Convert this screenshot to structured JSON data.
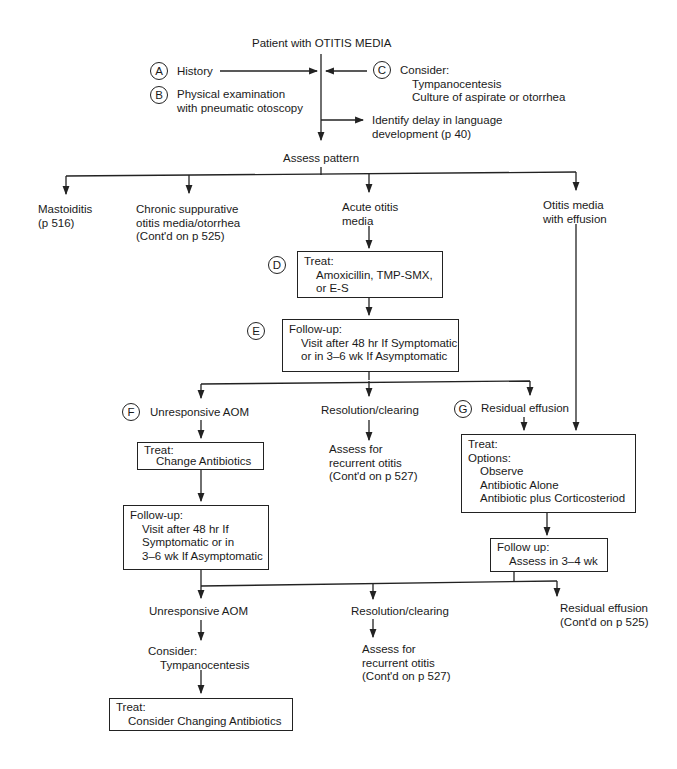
{
  "title": "Patient with OTITIS MEDIA",
  "steps": {
    "A": {
      "letter": "A",
      "text": "History"
    },
    "B": {
      "letter": "B",
      "line1": "Physical examination",
      "line2": "with pneumatic otoscopy"
    },
    "C": {
      "letter": "C",
      "heading": "Consider:",
      "items": [
        "Tympanocentesis",
        "Culture of aspirate or otorrhea"
      ]
    },
    "identify": {
      "line1": "Identify delay in language",
      "line2": "development (p 40)"
    },
    "assess": "Assess pattern"
  },
  "patterns": {
    "mastoiditis": {
      "line1": "Mastoiditis",
      "line2": "(p 516)"
    },
    "chronic": {
      "line1": "Chronic suppurative",
      "line2": "otitis media/otorrhea",
      "line3": "(Cont'd on p 525)"
    },
    "acute": {
      "line1": "Acute otitis",
      "line2": "media"
    },
    "effusion": {
      "line1": "Otitis media",
      "line2": "with effusion"
    }
  },
  "D": {
    "letter": "D",
    "heading": "Treat:",
    "line1": "Amoxicillin, TMP-SMX,",
    "line2": "or E-S"
  },
  "E": {
    "letter": "E",
    "heading": "Follow-up:",
    "line1": "Visit after 48 hr If Symptomatic",
    "line2": "or in 3–6 wk If Asymptomatic"
  },
  "F": {
    "letter": "F",
    "label": "Unresponsive AOM",
    "treat": {
      "heading": "Treat:",
      "line1": "Change Antibiotics"
    },
    "followup": {
      "heading": "Follow-up:",
      "line1": "Visit after 48 hr If",
      "line2": "Symptomatic or in",
      "line3": "3–6 wk If Asymptomatic"
    }
  },
  "resolution1": {
    "label": "Resolution/clearing",
    "line1": "Assess for",
    "line2": "recurrent otitis",
    "line3": "(Cont'd on p 527)"
  },
  "G": {
    "letter": "G",
    "label": "Residual effusion",
    "treat": {
      "heading": "Treat:",
      "options": "Options:",
      "items": [
        "Observe",
        "Antibiotic Alone",
        "Antibiotic plus Corticosteriod"
      ]
    },
    "followup": {
      "heading": "Follow up:",
      "line1": "Assess in 3–4 wk"
    }
  },
  "final": {
    "unresponsive": {
      "label": "Unresponsive AOM",
      "consider": "Consider:",
      "consider_item": "Tympanocentesis",
      "treat_heading": "Treat:",
      "treat_item": "Consider Changing Antibiotics"
    },
    "resolution": {
      "label": "Resolution/clearing",
      "line1": "Assess for",
      "line2": "recurrent otitis",
      "line3": "(Cont'd on p 527)"
    },
    "residual": {
      "line1": "Residual effusion",
      "line2": "(Cont'd on p 525)"
    }
  }
}
